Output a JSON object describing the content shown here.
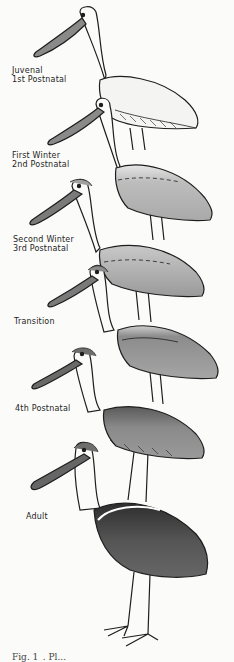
{
  "figure": {
    "stages": [
      {
        "line1": "Juvenal",
        "line2": "1st Postnatal"
      },
      {
        "line1": "First Winter",
        "line2": "2nd Postnatal"
      },
      {
        "line1": "Second Winter",
        "line2": "3rd Postnatal"
      },
      {
        "line1": "Transition",
        "line2": ""
      },
      {
        "line1": "4th Postnatal",
        "line2": ""
      },
      {
        "line1": "Adult",
        "line2": ""
      }
    ],
    "caption": "Fig. 1_. Pl..."
  },
  "colors": {
    "background": "#fbfbf9",
    "ink": "#1e1e1e",
    "wing_light": "#f4f4f2",
    "wing_mid": "#b8b8b8",
    "wing_dark": "#6e6e6e",
    "wing_darkest": "#3a3a3a"
  }
}
